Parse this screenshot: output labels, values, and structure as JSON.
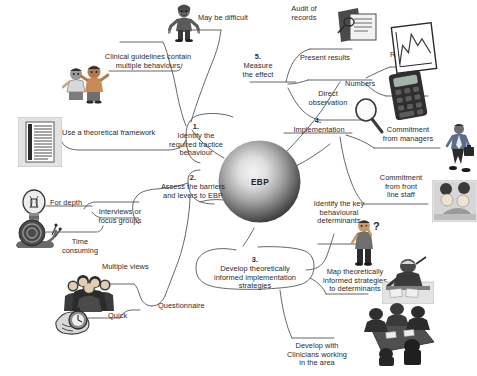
{
  "diagram": {
    "type": "mind-map",
    "center": {
      "label": "EBP",
      "shape": "sphere"
    },
    "background": "#ffffff",
    "line_color": "#55565a",
    "text_color": "#2b2b2b",
    "branches": [
      {
        "id": "b1",
        "number": "1.",
        "label": "Identify the\nrequired tractice\nbehaviour",
        "children": [
          {
            "label": "May be difficult",
            "icon": "person-shrug-icon"
          },
          {
            "label": "Clinical guidelines contain\nmultiple behaviours",
            "icon": "two-people-icon"
          },
          {
            "label": "Use a theoretical framework",
            "icon": "document-icon"
          }
        ]
      },
      {
        "id": "b2",
        "number": "2.",
        "label": "Assess the barriers\nand levers to EBP",
        "children": [
          {
            "label": "Interviews or\nfocus groups",
            "icon": "none"
          },
          {
            "label": "For depth",
            "icon": "lightbulb-icon"
          },
          {
            "label": "Time\nconsuming",
            "icon": "snail-icon"
          },
          {
            "label": "Questionnaire",
            "icon": "none"
          },
          {
            "label": "Multiple views",
            "icon": "crowd-icon"
          },
          {
            "label": "Quick",
            "icon": "stopwatch-icon"
          }
        ]
      },
      {
        "id": "b3",
        "number": "3.",
        "label": "Develop theoretically\ninformed implementation\nstrategies",
        "children": [
          {
            "label": "Identify the key\nbehavioural\ndeterminants",
            "icon": "thinking-person-icon"
          },
          {
            "label": "Map theoretically\ninformed strategies\nto determinants",
            "icon": "person-at-desk-icon"
          },
          {
            "label": "Develop with\nClinicians working\nin the area",
            "icon": "meeting-table-icon"
          }
        ]
      },
      {
        "id": "b4",
        "number": "4.",
        "label": "Implementation",
        "children": [
          {
            "label": "Commitment\nfrom managers",
            "icon": "businessman-icon"
          },
          {
            "label": "Commitment\nfrom front\nline staff",
            "icon": "staff-pair-icon"
          }
        ]
      },
      {
        "id": "b5",
        "number": "5.",
        "label": "Measure\nthe effect",
        "children": [
          {
            "label": "Audit of\nrecords",
            "icon": "folder-records-icon"
          },
          {
            "label": "Present results",
            "icon": "none"
          },
          {
            "label": "Run chart",
            "icon": "run-chart-icon"
          },
          {
            "label": "Numbers",
            "icon": "calculator-icon"
          },
          {
            "label": "Direct\nobservation",
            "icon": "magnifier-icon"
          }
        ]
      }
    ]
  },
  "labels": {
    "may_be_difficult": "May be difficult",
    "clinical_guidelines": "Clinical guidelines contain\nmultiple behaviours",
    "theoretical_framework": "Use a theoretical framework",
    "step1_num": "1.",
    "step1_text": "Identify the\nrequired tractice\nbehaviour",
    "step2_num": "2.",
    "step2_text": "Assess the barriers\nand levers to EBP",
    "step3_num": "3.",
    "step3_text": "Develop theoretically\ninformed implementation\nstrategies",
    "step4_num": "4.",
    "step4_text": "Implementation",
    "step5_num": "5.",
    "step5_text": "Measure\nthe effect",
    "audit_of_records": "Audit of\nrecords",
    "present_results": "Present results",
    "run_chart": "Run chart",
    "numbers": "Numbers",
    "direct_observation": "Direct\nobservation",
    "commitment_managers": "Commitment\nfrom managers",
    "commitment_front_line": "Commitment\nfrom front\nline staff",
    "identify_key_determinants": "Identify the key\nbehavioural\ndeterminants",
    "map_strategies": "Map theoretically\ninformed strategies\nto determinants",
    "develop_with_clinicians": "Develop with\nClinicians working\nin the area",
    "for_depth": "For depth",
    "interviews_focus_groups": "Interviews or\nfocus groups",
    "time_consuming": "Time\nconsuming",
    "multiple_views": "Multiple views",
    "quick": "Quick",
    "questionnaire": "Questionnaire",
    "center": "EBP"
  }
}
